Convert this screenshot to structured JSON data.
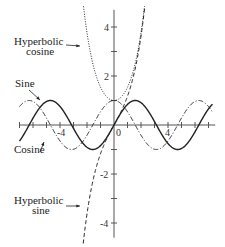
{
  "chart_data": {
    "type": "line",
    "title": "",
    "xlabel": "",
    "ylabel": "",
    "xlim": [
      -7.5,
      7.5
    ],
    "ylim": [
      -4.5,
      4.5
    ],
    "x_ticks_labeled": [
      -4,
      0,
      4
    ],
    "y_ticks_labeled": [
      4,
      2,
      -2,
      -4
    ],
    "grid": false,
    "series": [
      {
        "name": "Sine",
        "function": "sin(x)",
        "style": "solid"
      },
      {
        "name": "Cosine",
        "function": "cos(x)",
        "style": "dash-dot"
      },
      {
        "name": "Hyperbolic cosine",
        "function": "cosh(x)",
        "style": "dotted"
      },
      {
        "name": "Hyperbolic sine",
        "function": "sinh(x)",
        "style": "dashed"
      }
    ],
    "annotations": [
      {
        "text": "Hyperbolic cosine",
        "points_to": "cosh curve"
      },
      {
        "text": "Sine",
        "points_to": "sine curve"
      },
      {
        "text": "Cosine",
        "points_to": "cosine curve"
      },
      {
        "text": "Hyperbolic sine",
        "points_to": "sinh curve"
      }
    ]
  },
  "labels": {
    "cosh_line1": "Hyperbolic",
    "cosh_line2": "cosine",
    "sine": "Sine",
    "cosine": "Cosine",
    "sinh_line1": "Hyperbolic",
    "sinh_line2": "sine"
  },
  "ticks": {
    "x_neg4": "-4",
    "x_0": "0",
    "x_4": "4",
    "y_4": "4",
    "y_2": "2",
    "y_neg2": "-2",
    "y_neg4": "-4"
  }
}
